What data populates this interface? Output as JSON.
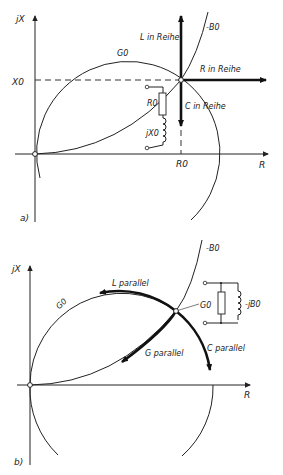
{
  "figure_a": {
    "panel_label": "a)",
    "axis_y_label": "jX",
    "axis_x_label": "R",
    "x0_label": "X0",
    "r0_label": "R0",
    "g0_label": "G0",
    "b0_label": "-B0",
    "arrow_up_label": "L in Reihe",
    "arrow_right_label": "R in Reihe",
    "arrow_down_label": "C in Reihe",
    "circuit": {
      "resistor_label": "R0",
      "inductor_label": "jX0"
    }
  },
  "figure_b": {
    "panel_label": "b)",
    "axis_y_label": "jX",
    "axis_x_label": "R",
    "g0_label": "G0",
    "b0_label": "-B0",
    "arrow_l_label": "L parallel",
    "arrow_g_label": "G parallel",
    "arrow_c_label": "C parallel",
    "circuit": {
      "resistor_label": "G0",
      "inductor_label": "-jB0"
    }
  }
}
